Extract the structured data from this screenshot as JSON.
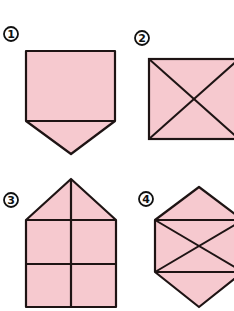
{
  "colors": {
    "fill": "#f6c9cf",
    "stroke": "#1e1414"
  },
  "figures": [
    {
      "label": "①",
      "shape": "pentagon (square with downward point)"
    },
    {
      "label": "②",
      "shape": "rectangle with both diagonals"
    },
    {
      "label": "③",
      "shape": "house (pentagon) divided into grid"
    },
    {
      "label": "④",
      "shape": "hexagon with two horizontals and crossing diagonals"
    }
  ]
}
